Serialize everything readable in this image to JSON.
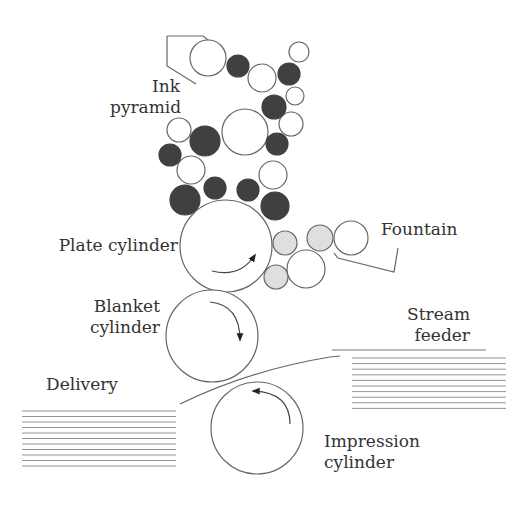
{
  "labels": {
    "ink_pyramid": [
      "Ink",
      "pyramid"
    ],
    "plate_cylinder": "Plate cylinder",
    "blanket_cylinder": [
      "Blanket",
      "cylinder"
    ],
    "fountain": "Fountain",
    "stream_feeder": [
      "Stream",
      "feeder"
    ],
    "delivery": "Delivery",
    "impression_cylinder": [
      "Impression",
      "cylinder"
    ]
  },
  "colors": {
    "line": "#666666",
    "ink_roller": "#404040",
    "dampening_roller": "#dcdcdc",
    "text": "#333333"
  },
  "rollers": {
    "ink_open": [
      {
        "cx": 208,
        "cy": 58,
        "r": 18
      },
      {
        "cx": 262,
        "cy": 78,
        "r": 14
      },
      {
        "cx": 299,
        "cy": 52,
        "r": 10
      },
      {
        "cx": 295,
        "cy": 96,
        "r": 9
      },
      {
        "cx": 245,
        "cy": 132,
        "r": 23
      },
      {
        "cx": 291,
        "cy": 124,
        "r": 12
      },
      {
        "cx": 179,
        "cy": 130,
        "r": 12
      },
      {
        "cx": 191,
        "cy": 170,
        "r": 14
      },
      {
        "cx": 273,
        "cy": 175,
        "r": 14
      }
    ],
    "ink_filled": [
      {
        "cx": 238,
        "cy": 66,
        "r": 11
      },
      {
        "cx": 289,
        "cy": 74,
        "r": 11
      },
      {
        "cx": 274,
        "cy": 107,
        "r": 12
      },
      {
        "cx": 205,
        "cy": 141,
        "r": 15
      },
      {
        "cx": 277,
        "cy": 144,
        "r": 11
      },
      {
        "cx": 170,
        "cy": 155,
        "r": 11
      },
      {
        "cx": 185,
        "cy": 200,
        "r": 15
      },
      {
        "cx": 215,
        "cy": 188,
        "r": 11
      },
      {
        "cx": 248,
        "cy": 190,
        "r": 11
      },
      {
        "cx": 275,
        "cy": 206,
        "r": 14
      }
    ],
    "dampening_shaded": [
      {
        "cx": 285,
        "cy": 243,
        "r": 12
      },
      {
        "cx": 320,
        "cy": 238,
        "r": 13
      },
      {
        "cx": 276,
        "cy": 277,
        "r": 12
      }
    ],
    "dampening_open": [
      {
        "cx": 351,
        "cy": 238,
        "r": 17
      },
      {
        "cx": 306,
        "cy": 269,
        "r": 19
      }
    ]
  },
  "cylinders": {
    "plate": {
      "cx": 226,
      "cy": 246,
      "r": 46
    },
    "blanket": {
      "cx": 212,
      "cy": 336,
      "r": 46
    },
    "impression": {
      "cx": 257,
      "cy": 428,
      "r": 46
    }
  }
}
